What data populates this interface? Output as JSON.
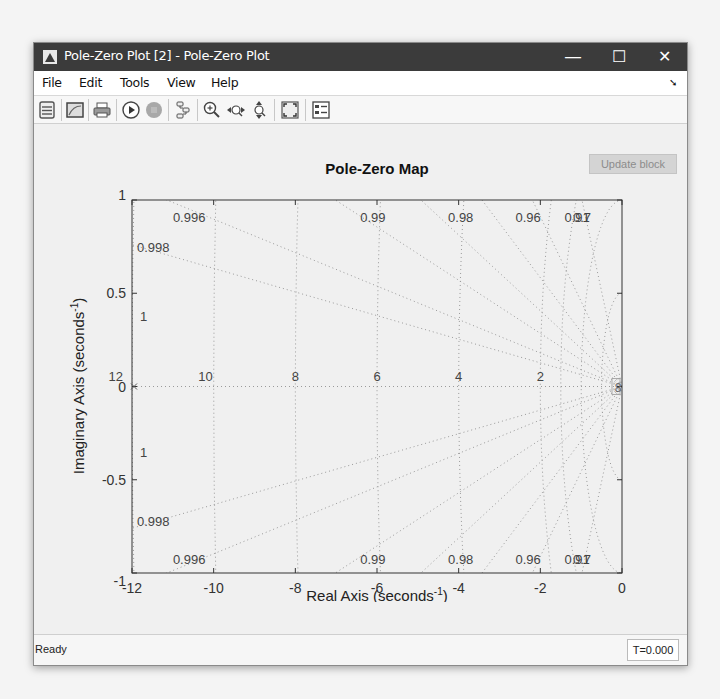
{
  "window": {
    "title": "Pole-Zero Plot [2] - Pole-Zero Plot",
    "controls": {
      "minimize": "—",
      "maximize": "☐",
      "close": "✕"
    }
  },
  "menu": {
    "items": [
      {
        "label": "File"
      },
      {
        "label": "Edit"
      },
      {
        "label": "Tools"
      },
      {
        "label": "View"
      },
      {
        "label": "Help"
      }
    ],
    "dock_arrow": "➘"
  },
  "toolbar": {
    "buttons": [
      {
        "icon": "block-parameters-icon"
      },
      {
        "icon": "figure-icon"
      },
      {
        "icon": "print-icon"
      },
      {
        "icon": "run-icon"
      },
      {
        "icon": "stop-icon"
      },
      {
        "icon": "highlight-block-icon"
      },
      {
        "icon": "zoom-in-icon"
      },
      {
        "icon": "zoom-x-icon"
      },
      {
        "icon": "zoom-y-icon"
      },
      {
        "icon": "fit-to-view-icon"
      },
      {
        "icon": "legend-icon"
      }
    ]
  },
  "update_block_label": "Update block",
  "status": {
    "text": "Ready",
    "time": "T=0.000"
  },
  "chart_data": {
    "type": "scatter",
    "title": "Pole-Zero Map",
    "xlabel": "Real Axis (seconds^-1)",
    "ylabel": "Imaginary Axis (seconds^-1)",
    "xlim": [
      -12,
      0
    ],
    "ylim": [
      -1,
      1
    ],
    "xticks": [
      "-12",
      "-10",
      "-8",
      "-6",
      "-4",
      "-2",
      "0"
    ],
    "yticks": [
      "1",
      "0.5",
      "0",
      "-0.5",
      "-1"
    ],
    "grid": "sgrid (damping / natural frequency)",
    "damping_labels": [
      "0.996",
      "0.99",
      "0.98",
      "0.96",
      "0.91",
      "0.7",
      "0.998",
      "1"
    ],
    "damping_values": [
      1,
      0.998,
      0.996,
      0.99,
      0.98,
      0.96,
      0.91,
      0.7
    ],
    "natural_frequency_labels": [
      "12",
      "10",
      "8",
      "6",
      "4",
      "2"
    ],
    "natural_frequency_values": [
      12,
      10,
      8,
      6,
      4,
      2
    ],
    "poles": [
      {
        "x": -12,
        "y": 0
      }
    ],
    "zeros": []
  }
}
